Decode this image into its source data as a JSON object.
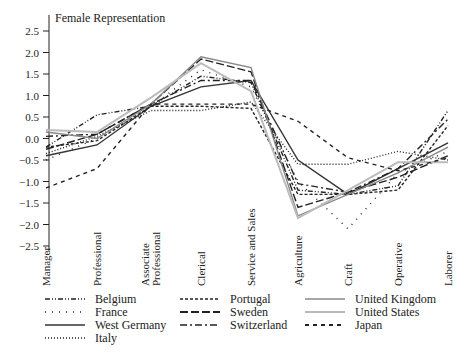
{
  "chart_data": {
    "type": "line",
    "title": "Female Representation",
    "xlabel": "",
    "ylabel": "Female Representation",
    "ylim": [
      -2.5,
      2.5
    ],
    "yticks": [
      "2.5",
      "2.0",
      "1.5",
      "1.0",
      "0.5",
      "0.0",
      "−0.5",
      "−1.0",
      "−1.5",
      "−2.0",
      "−2.5"
    ],
    "ytick_values": [
      2.5,
      2.0,
      1.5,
      1.0,
      0.5,
      0.0,
      -0.5,
      -1.0,
      -1.5,
      -2.0,
      -2.5
    ],
    "grid": false,
    "legend_position": "bottom",
    "categories": [
      "Manager",
      "Professional",
      "Associate Professional",
      "Clerical",
      "Service and Sales",
      "Agriculture",
      "Craft",
      "Operative",
      "Laborer"
    ],
    "series": [
      {
        "name": "Belgium",
        "style": "dashdotdot",
        "color": "#222222",
        "values": [
          -0.2,
          0.55,
          0.75,
          1.45,
          1.3,
          -1.2,
          -1.3,
          -1.1,
          0.65
        ]
      },
      {
        "name": "France",
        "style": "sparsedot",
        "color": "#222222",
        "values": [
          -0.5,
          0.0,
          0.75,
          1.6,
          1.2,
          -1.0,
          -2.1,
          -0.8,
          -0.3
        ]
      },
      {
        "name": "West Germany",
        "style": "solid",
        "color": "#333333",
        "values": [
          -0.4,
          -0.15,
          0.75,
          1.2,
          1.35,
          -0.5,
          -1.3,
          -0.7,
          -0.1
        ]
      },
      {
        "name": "Italy",
        "style": "dot",
        "color": "#222222",
        "values": [
          -0.35,
          0.05,
          0.65,
          0.65,
          0.85,
          -0.6,
          -0.6,
          -0.3,
          -0.5
        ]
      },
      {
        "name": "Portugal",
        "style": "dash",
        "color": "#222222",
        "values": [
          -0.2,
          -0.05,
          0.75,
          0.75,
          0.7,
          -1.3,
          -1.3,
          -1.2,
          0.3
        ]
      },
      {
        "name": "Sweden",
        "style": "longdash",
        "color": "#222222",
        "values": [
          -0.25,
          0.1,
          0.8,
          1.85,
          1.55,
          -1.6,
          -1.25,
          -0.9,
          -0.4
        ]
      },
      {
        "name": "Switzerland",
        "style": "dashdot",
        "color": "#222222",
        "values": [
          0.05,
          0.1,
          0.8,
          1.35,
          1.35,
          -1.05,
          -1.25,
          -0.7,
          0.45
        ]
      },
      {
        "name": "United Kingdom",
        "style": "solid",
        "color": "#888888",
        "values": [
          0.15,
          0.0,
          0.8,
          1.9,
          1.65,
          -1.8,
          -1.3,
          -0.8,
          -0.2
        ]
      },
      {
        "name": "United States",
        "style": "solid",
        "color": "#bbbbbb",
        "values": [
          0.2,
          0.15,
          0.95,
          1.75,
          1.1,
          -1.85,
          -1.2,
          -0.55,
          -0.55
        ]
      },
      {
        "name": "Japan",
        "style": "widedash",
        "color": "#222222",
        "values": [
          -1.15,
          -0.7,
          0.8,
          0.8,
          0.8,
          0.4,
          -0.45,
          -0.75,
          -0.45
        ]
      }
    ]
  },
  "legend": {
    "items": [
      {
        "label": "Belgium"
      },
      {
        "label": "France"
      },
      {
        "label": "West Germany"
      },
      {
        "label": "Italy"
      },
      {
        "label": "Portugal"
      },
      {
        "label": "Sweden"
      },
      {
        "label": "Switzerland"
      },
      {
        "label": "United Kingdom"
      },
      {
        "label": "United States"
      },
      {
        "label": "Japan"
      }
    ]
  }
}
